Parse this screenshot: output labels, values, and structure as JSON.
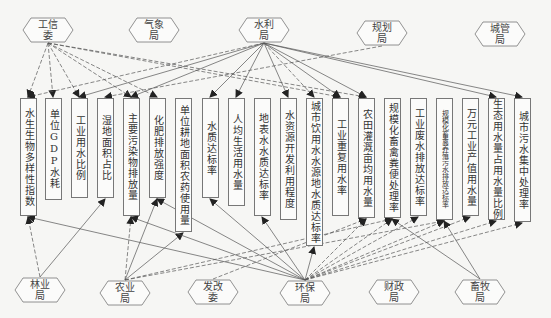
{
  "diagram": {
    "top_agencies": [
      {
        "id": "gongxin",
        "label": "工信委",
        "x": 48,
        "y": 30
      },
      {
        "id": "qixiang",
        "label": "气象局",
        "x": 154,
        "y": 30
      },
      {
        "id": "shuili",
        "label": "水利局",
        "x": 264,
        "y": 30
      },
      {
        "id": "guihua",
        "label": "规划局",
        "x": 382,
        "y": 33
      },
      {
        "id": "chengguan",
        "label": "城管局",
        "x": 500,
        "y": 34
      }
    ],
    "bottom_agencies": [
      {
        "id": "linye",
        "label": "林业局",
        "x": 40,
        "y": 290
      },
      {
        "id": "nongye",
        "label": "农业局",
        "x": 125,
        "y": 293
      },
      {
        "id": "fagai",
        "label": "发改委",
        "x": 213,
        "y": 292
      },
      {
        "id": "huanbao",
        "label": "环保局",
        "x": 305,
        "y": 293
      },
      {
        "id": "caizheng",
        "label": "财政局",
        "x": 394,
        "y": 292
      },
      {
        "id": "xumu",
        "label": "畜牧局",
        "x": 480,
        "y": 292
      }
    ],
    "indicators": [
      {
        "label": "水生生物多样性指数",
        "x": 28,
        "h": 118,
        "small": false
      },
      {
        "label": "单位GDP水耗",
        "x": 53,
        "h": 102,
        "small": false
      },
      {
        "label": "工业用水比例",
        "x": 79,
        "h": 100,
        "small": false
      },
      {
        "label": "湿地面积占比",
        "x": 105,
        "h": 100,
        "small": false
      },
      {
        "label": "主要污染物排放量",
        "x": 131,
        "h": 118,
        "small": false
      },
      {
        "label": "化肥排放强度",
        "x": 157,
        "h": 100,
        "small": false
      },
      {
        "label": "单位耕地面积农药使用量",
        "x": 183,
        "h": 134,
        "small": false
      },
      {
        "label": "水质达标率",
        "x": 210,
        "h": 100,
        "small": false
      },
      {
        "label": "人均生活用水量",
        "x": 236,
        "h": 108,
        "small": false
      },
      {
        "label": "地表水水质达标率",
        "x": 262,
        "h": 118,
        "small": false
      },
      {
        "label": "水资源开发利用程度",
        "x": 288,
        "h": 122,
        "small": false
      },
      {
        "label": "城市饮用水水源地水质达标率",
        "x": 314,
        "h": 148,
        "small": false
      },
      {
        "label": "工业重复用水率",
        "x": 340,
        "h": 118,
        "small": false
      },
      {
        "label": "农田灌溉亩均用水量",
        "x": 366,
        "h": 120,
        "small": false
      },
      {
        "label": "规模化畜禽粪便处理率",
        "x": 392,
        "h": 120,
        "small": false
      },
      {
        "label": "工业废水排放达标率",
        "x": 418,
        "h": 118,
        "small": false
      },
      {
        "label": "规模化畜禽养殖污水排放达标率",
        "x": 444,
        "h": 122,
        "small": true
      },
      {
        "label": "万元工业产值用水量",
        "x": 470,
        "h": 118,
        "small": false
      },
      {
        "label": "生态用水量占用水量比例",
        "x": 496,
        "h": 122,
        "small": false
      },
      {
        "label": "城市污水集中处理率",
        "x": 522,
        "h": 124,
        "small": false
      }
    ],
    "colors": {
      "background": "#f6f6f4",
      "line": "#555555",
      "box_border": "#777777"
    }
  }
}
